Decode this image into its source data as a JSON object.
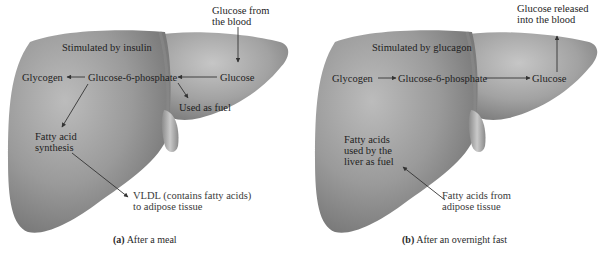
{
  "panels": [
    {
      "id": "a",
      "caption_letter": "(a)",
      "caption_text": "After a meal",
      "stimulus": "Stimulated by insulin",
      "top_label": "Glucose from\nthe blood",
      "glycogen": "Glycogen",
      "g6p": "Glucose-6-phosphate",
      "glucose": "Glucose",
      "used_as_fuel": "Used as fuel",
      "fatty_acid_synthesis": "Fatty acid\nsynthesis",
      "vldl": "VLDL (contains fatty acids)\nto adipose tissue"
    },
    {
      "id": "b",
      "caption_letter": "(b)",
      "caption_text": "After an overnight fast",
      "stimulus": "Stimulated by glucagon",
      "top_label": "Glucose released\ninto the blood",
      "glycogen": "Glycogen",
      "g6p": "Glucose-6-phosphate",
      "glucose": "Glucose",
      "fatty_acids_used": "Fatty acids\nused by the\nliver as fuel",
      "fatty_acids_from": "Fatty acids from\nadipose tissue"
    }
  ],
  "colors": {
    "liver_light": "#b4b4b4",
    "liver_mid": "#8f8f8f",
    "liver_dark": "#6e6e6e",
    "arrow": "#333333",
    "text": "#1e1e1e"
  }
}
